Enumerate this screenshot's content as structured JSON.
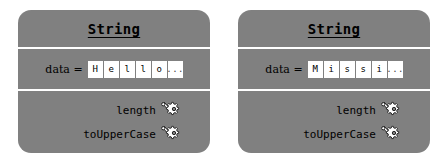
{
  "diagram": {
    "type": "uml-object-diagram",
    "background_color": "#ffffff",
    "card_color": "#808080",
    "divider_color": "#ffffff",
    "cell_color": "#ffffff",
    "text_color": "#000000",
    "cards": [
      {
        "title": "String",
        "field": {
          "label": "data =",
          "cells": [
            "H",
            "e",
            "l",
            "l",
            "o",
            "..."
          ]
        },
        "methods": [
          {
            "label": "length",
            "icon": "gear-icon"
          },
          {
            "label": "toUpperCase",
            "icon": "gear-icon"
          }
        ]
      },
      {
        "title": "String",
        "field": {
          "label": "data =",
          "cells": [
            "M",
            "i",
            "s",
            "s",
            "i",
            "..."
          ]
        },
        "methods": [
          {
            "label": "length",
            "icon": "gear-icon"
          },
          {
            "label": "toUpperCase",
            "icon": "gear-icon"
          }
        ]
      }
    ]
  }
}
